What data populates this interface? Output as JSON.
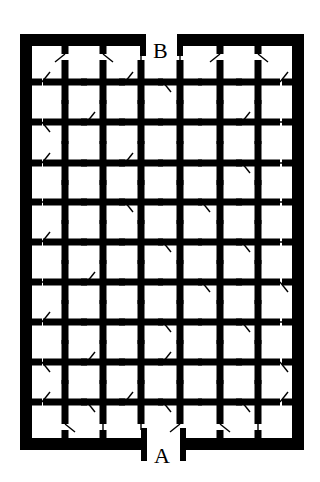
{
  "diagram": {
    "type": "door-maze",
    "labels": {
      "top": "B",
      "bottom": "A"
    },
    "colors": {
      "wall": "#000000",
      "background": "#ffffff"
    },
    "grid": {
      "columns_x": [
        65,
        103,
        141,
        180,
        220,
        258
      ],
      "rows_y": [
        82,
        122,
        163,
        202,
        242,
        282,
        322,
        362,
        402
      ],
      "left_wall_x": 26,
      "right_wall_x": 298,
      "top_wall_y": 40,
      "bottom_wall_y": 444
    },
    "h_doors": [
      [
        "o",
        "c",
        "o",
        "o",
        "c",
        "c",
        "o"
      ],
      [
        "o",
        "o",
        "c",
        "c",
        "c",
        "o",
        "c"
      ],
      [
        "o",
        "c",
        "o",
        "c",
        "c",
        "o",
        "c"
      ],
      [
        "c",
        "c",
        "o",
        "c",
        "o",
        "c",
        "c"
      ],
      [
        "o",
        "c",
        "c",
        "o",
        "c",
        "o",
        "c"
      ],
      [
        "c",
        "o",
        "c",
        "c",
        "o",
        "c",
        "o"
      ],
      [
        "o",
        "c",
        "c",
        "o",
        "c",
        "o",
        "c"
      ],
      [
        "o",
        "o",
        "c",
        "o",
        "c",
        "c",
        "o"
      ],
      [
        "o",
        "o",
        "o",
        "o",
        "c",
        "o",
        "o"
      ]
    ],
    "v_doors": [
      [
        "o",
        "o",
        "c",
        "c",
        "o",
        "o"
      ],
      [
        "c",
        "c",
        "o",
        "o",
        "o",
        "c"
      ],
      [
        "o",
        "o",
        "c",
        "c",
        "o",
        "o"
      ],
      [
        "c",
        "o",
        "o",
        "o",
        "c",
        "o"
      ],
      [
        "o",
        "c",
        "o",
        "c",
        "o",
        "c"
      ],
      [
        "c",
        "o",
        "c",
        "o",
        "c",
        "o"
      ],
      [
        "o",
        "c",
        "o",
        "c",
        "o",
        "c"
      ],
      [
        "c",
        "o",
        "c",
        "o",
        "o",
        "o"
      ],
      [
        "o",
        "c",
        "o",
        "o",
        "c",
        "o"
      ],
      [
        "o",
        "c",
        "c",
        "o",
        "o",
        "c"
      ]
    ]
  }
}
